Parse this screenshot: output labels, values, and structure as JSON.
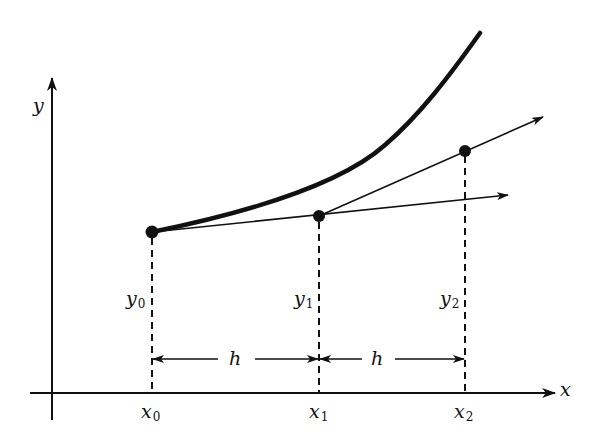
{
  "figure": {
    "colors": {
      "ink": "#111111",
      "background": "#ffffff"
    },
    "axes": {
      "x_label": "x",
      "y_label": "y"
    },
    "points": [
      {
        "x_label": "x",
        "x_sub": "0",
        "y_label": "y",
        "y_sub": "0"
      },
      {
        "x_label": "x",
        "x_sub": "1",
        "y_label": "y",
        "y_sub": "1"
      },
      {
        "x_label": "x",
        "x_sub": "2",
        "y_label": "y",
        "y_sub": "2"
      }
    ],
    "intervals": [
      {
        "label": "h"
      },
      {
        "label": "h"
      }
    ],
    "elements": {
      "curve": "exact solution curve (thick)",
      "tangent_1": "tangent line from point 0 through point 1 (arrow)",
      "tangent_2": "tangent line from point 1 through point 2 (arrow)",
      "ordinates": "dashed vertical lines from each point to x-axis"
    }
  }
}
